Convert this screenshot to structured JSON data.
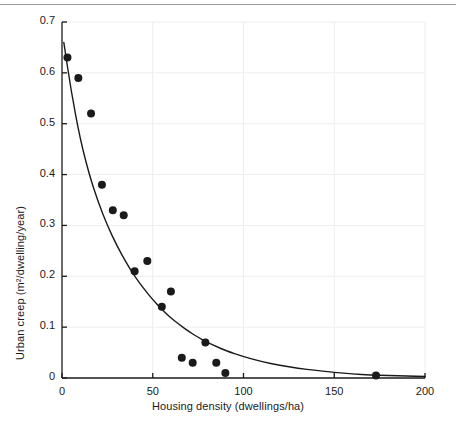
{
  "figure": {
    "background_color": "#ffffff",
    "ink_color": "#1a1a1a",
    "gridline_color": "#ededf0",
    "has_top_rule": true
  },
  "chart_data": {
    "type": "scatter",
    "title": "",
    "subtitle": "",
    "xlabel": "Housing density (dwellings/ha)",
    "ylabel": "Urban creep (m²/dwelling/year)",
    "xlim": [
      0,
      200
    ],
    "ylim": [
      0,
      0.7
    ],
    "xticks": [
      0,
      50,
      100,
      150,
      200
    ],
    "xticklabels": [
      "0",
      "50",
      "100",
      "150",
      "200"
    ],
    "yticks": [
      0,
      0.1,
      0.2,
      0.3,
      0.4,
      0.5,
      0.6,
      0.7
    ],
    "yticklabels": [
      "0",
      "0.1",
      "0.2",
      "0.3",
      "0.4",
      "0.5",
      "0.6",
      "0.7"
    ],
    "grid": true,
    "legend": null,
    "legend_position": "none",
    "annotations": [],
    "series": [
      {
        "name": "Observed urban creep",
        "type": "scatter",
        "marker": "filled-circle",
        "marker_size_px": 8,
        "color": "#1a1a1a",
        "points": [
          {
            "x": 3,
            "y": 0.63
          },
          {
            "x": 9,
            "y": 0.59
          },
          {
            "x": 16,
            "y": 0.52
          },
          {
            "x": 22,
            "y": 0.38
          },
          {
            "x": 28,
            "y": 0.33
          },
          {
            "x": 34,
            "y": 0.32
          },
          {
            "x": 40,
            "y": 0.21
          },
          {
            "x": 47,
            "y": 0.23
          },
          {
            "x": 55,
            "y": 0.14
          },
          {
            "x": 60,
            "y": 0.17
          },
          {
            "x": 66,
            "y": 0.04
          },
          {
            "x": 72,
            "y": 0.03
          },
          {
            "x": 79,
            "y": 0.07
          },
          {
            "x": 85,
            "y": 0.03
          },
          {
            "x": 90,
            "y": 0.01
          },
          {
            "x": 173,
            "y": 0.005
          }
        ]
      },
      {
        "name": "Fitted exponential decay curve",
        "type": "line",
        "color": "#1a1a1a",
        "line_width_px": 1.4,
        "points": [
          {
            "x": 1,
            "y": 0.66
          },
          {
            "x": 5,
            "y": 0.565
          },
          {
            "x": 10,
            "y": 0.47
          },
          {
            "x": 15,
            "y": 0.4
          },
          {
            "x": 20,
            "y": 0.345
          },
          {
            "x": 25,
            "y": 0.3
          },
          {
            "x": 30,
            "y": 0.262
          },
          {
            "x": 35,
            "y": 0.229
          },
          {
            "x": 40,
            "y": 0.2
          },
          {
            "x": 45,
            "y": 0.176
          },
          {
            "x": 50,
            "y": 0.154
          },
          {
            "x": 55,
            "y": 0.135
          },
          {
            "x": 60,
            "y": 0.118
          },
          {
            "x": 65,
            "y": 0.104
          },
          {
            "x": 70,
            "y": 0.091
          },
          {
            "x": 75,
            "y": 0.08
          },
          {
            "x": 80,
            "y": 0.07
          },
          {
            "x": 85,
            "y": 0.062
          },
          {
            "x": 90,
            "y": 0.054
          },
          {
            "x": 100,
            "y": 0.042
          },
          {
            "x": 110,
            "y": 0.032
          },
          {
            "x": 120,
            "y": 0.025
          },
          {
            "x": 130,
            "y": 0.019
          },
          {
            "x": 140,
            "y": 0.015
          },
          {
            "x": 150,
            "y": 0.011
          },
          {
            "x": 160,
            "y": 0.008
          },
          {
            "x": 170,
            "y": 0.006
          },
          {
            "x": 180,
            "y": 0.005
          },
          {
            "x": 190,
            "y": 0.004
          },
          {
            "x": 200,
            "y": 0.003
          }
        ]
      }
    ]
  }
}
